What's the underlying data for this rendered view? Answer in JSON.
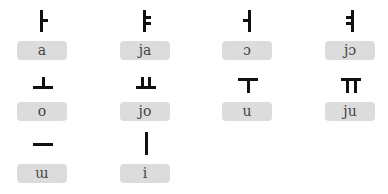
{
  "vowels": [
    {
      "glyph": "ㅏ",
      "glyph_name": "a-vowel-glyph",
      "romanization": "a"
    },
    {
      "glyph": "ㅑ",
      "glyph_name": "ya-vowel-glyph",
      "romanization": "ja"
    },
    {
      "glyph": "ㅓ",
      "glyph_name": "eo-vowel-glyph",
      "romanization": "ɔ"
    },
    {
      "glyph": "ㅕ",
      "glyph_name": "yeo-vowel-glyph",
      "romanization": "jɔ"
    },
    {
      "glyph": "ㅗ",
      "glyph_name": "o-vowel-glyph",
      "romanization": "o"
    },
    {
      "glyph": "ㅛ",
      "glyph_name": "yo-vowel-glyph",
      "romanization": "jo"
    },
    {
      "glyph": "ㅜ",
      "glyph_name": "u-vowel-glyph",
      "romanization": "u"
    },
    {
      "glyph": "ㅠ",
      "glyph_name": "yu-vowel-glyph",
      "romanization": "ju"
    },
    {
      "glyph": "ㅡ",
      "glyph_name": "eu-vowel-glyph",
      "romanization": "ɯ"
    },
    {
      "glyph": "ㅣ",
      "glyph_name": "i-vowel-glyph",
      "romanization": "i"
    }
  ],
  "colors": {
    "glyph": "#111111",
    "box_bg": "#dcdcdc",
    "box_text": "#444444"
  }
}
